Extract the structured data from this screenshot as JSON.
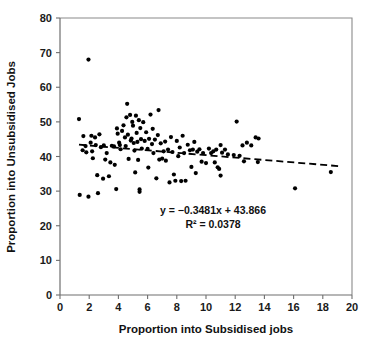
{
  "chart_data": {
    "type": "scatter",
    "title": "",
    "xlabel": "Proportion into Subsidised jobs",
    "ylabel": "Proportion into Unsubsidised Jobs",
    "xlim": [
      0,
      20
    ],
    "ylim": [
      0,
      80
    ],
    "xticks": [
      0,
      2,
      4,
      6,
      8,
      10,
      12,
      14,
      16,
      18,
      20
    ],
    "yticks": [
      0,
      10,
      20,
      30,
      40,
      50,
      60,
      70,
      80
    ],
    "grid": false,
    "legend": null,
    "annotations": [
      "y = −0.3481x + 43.866",
      "R² = 0.0378"
    ],
    "trendline": {
      "type": "linear",
      "slope": -0.3481,
      "intercept": 43.866,
      "r_squared": 0.0378,
      "style": "dashed",
      "x_start": 1.3,
      "x_end": 19.2
    },
    "marker": {
      "shape": "circle",
      "color": "#000000",
      "size_px": 4.2
    },
    "points": [
      [
        1.3,
        50.8
      ],
      [
        1.35,
        28.9
      ],
      [
        1.55,
        41.8
      ],
      [
        1.6,
        45.9
      ],
      [
        1.75,
        43.0
      ],
      [
        1.8,
        41.2
      ],
      [
        1.95,
        68.0
      ],
      [
        1.95,
        28.4
      ],
      [
        2.1,
        44.0
      ],
      [
        2.15,
        46.0
      ],
      [
        2.2,
        41.5
      ],
      [
        2.25,
        39.5
      ],
      [
        2.4,
        45.5
      ],
      [
        2.45,
        43.3
      ],
      [
        2.55,
        34.6
      ],
      [
        2.6,
        29.4
      ],
      [
        2.7,
        46.4
      ],
      [
        2.8,
        42.7
      ],
      [
        2.95,
        33.6
      ],
      [
        3.0,
        43.2
      ],
      [
        3.1,
        39.1
      ],
      [
        3.2,
        41.0
      ],
      [
        3.35,
        34.3
      ],
      [
        3.45,
        38.3
      ],
      [
        3.55,
        43.1
      ],
      [
        3.7,
        42.9
      ],
      [
        3.75,
        37.6
      ],
      [
        3.85,
        30.6
      ],
      [
        3.9,
        48.1
      ],
      [
        3.95,
        46.6
      ],
      [
        4.05,
        44.0
      ],
      [
        4.1,
        43.3
      ],
      [
        4.15,
        42.1
      ],
      [
        4.25,
        47.4
      ],
      [
        4.35,
        49.0
      ],
      [
        4.45,
        45.5
      ],
      [
        4.5,
        43.0
      ],
      [
        4.55,
        51.3
      ],
      [
        4.6,
        55.2
      ],
      [
        4.65,
        46.3
      ],
      [
        4.7,
        39.3
      ],
      [
        4.8,
        52.0
      ],
      [
        4.85,
        44.6
      ],
      [
        4.9,
        45.2
      ],
      [
        4.95,
        50.0
      ],
      [
        5.0,
        48.9
      ],
      [
        5.05,
        43.9
      ],
      [
        5.1,
        41.7
      ],
      [
        5.15,
        35.4
      ],
      [
        5.2,
        51.8
      ],
      [
        5.25,
        46.8
      ],
      [
        5.3,
        44.2
      ],
      [
        5.35,
        39.0
      ],
      [
        5.4,
        50.5
      ],
      [
        5.45,
        30.5
      ],
      [
        5.45,
        29.8
      ],
      [
        5.5,
        48.2
      ],
      [
        5.55,
        45.0
      ],
      [
        5.6,
        42.3
      ],
      [
        5.7,
        49.9
      ],
      [
        5.8,
        44.5
      ],
      [
        5.9,
        47.0
      ],
      [
        6.0,
        42.2
      ],
      [
        6.05,
        36.8
      ],
      [
        6.1,
        45.1
      ],
      [
        6.2,
        52.1
      ],
      [
        6.3,
        43.6
      ],
      [
        6.35,
        48.0
      ],
      [
        6.4,
        41.0
      ],
      [
        6.5,
        44.9
      ],
      [
        6.6,
        33.7
      ],
      [
        6.7,
        46.2
      ],
      [
        6.75,
        53.4
      ],
      [
        6.8,
        39.1
      ],
      [
        6.9,
        43.8
      ],
      [
        7.0,
        39.4
      ],
      [
        7.1,
        41.5
      ],
      [
        7.2,
        44.3
      ],
      [
        7.25,
        38.8
      ],
      [
        7.4,
        42.0
      ],
      [
        7.5,
        32.5
      ],
      [
        7.6,
        45.6
      ],
      [
        7.7,
        41.3
      ],
      [
        7.8,
        34.8
      ],
      [
        7.9,
        33.0
      ],
      [
        8.0,
        44.5
      ],
      [
        8.1,
        40.1
      ],
      [
        8.2,
        42.6
      ],
      [
        8.3,
        32.9
      ],
      [
        8.4,
        46.0
      ],
      [
        8.5,
        41.0
      ],
      [
        8.6,
        33.0
      ],
      [
        8.75,
        43.4
      ],
      [
        8.9,
        41.8
      ],
      [
        9.0,
        37.0
      ],
      [
        9.1,
        42.0
      ],
      [
        9.2,
        44.2
      ],
      [
        9.3,
        35.2
      ],
      [
        9.4,
        41.4
      ],
      [
        9.55,
        42.1
      ],
      [
        9.7,
        38.5
      ],
      [
        9.8,
        41.0
      ],
      [
        10.0,
        38.1
      ],
      [
        10.2,
        42.3
      ],
      [
        10.35,
        41.0
      ],
      [
        10.5,
        41.5
      ],
      [
        10.6,
        38.3
      ],
      [
        10.7,
        42.0
      ],
      [
        10.8,
        36.9
      ],
      [
        10.9,
        36.4
      ],
      [
        11.0,
        43.3
      ],
      [
        11.0,
        34.5
      ],
      [
        11.1,
        41.1
      ],
      [
        11.3,
        42.0
      ],
      [
        11.5,
        40.6
      ],
      [
        11.9,
        40.4
      ],
      [
        12.1,
        50.1
      ],
      [
        12.3,
        40.2
      ],
      [
        12.5,
        43.2
      ],
      [
        12.6,
        38.6
      ],
      [
        12.8,
        44.0
      ],
      [
        13.1,
        43.2
      ],
      [
        13.4,
        45.5
      ],
      [
        13.55,
        38.4
      ],
      [
        13.6,
        45.2
      ],
      [
        16.1,
        30.8
      ],
      [
        18.55,
        35.5
      ]
    ]
  },
  "layout": {
    "plot_left_px": 60,
    "plot_right_px": 352,
    "plot_top_px": 18,
    "plot_bottom_px": 295
  }
}
